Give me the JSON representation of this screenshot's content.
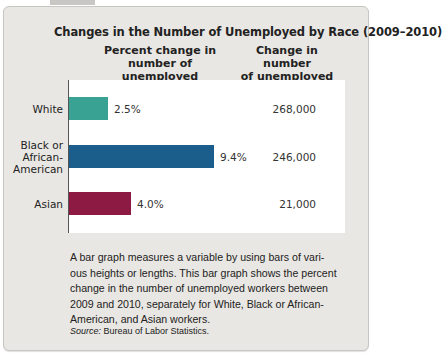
{
  "chart_data": {
    "type": "bar",
    "orientation": "horizontal",
    "title": "Changes in the Number of Unemployed by Race (2009–2010)",
    "column_headers": [
      "Percent change in\nnumber of unemployed",
      "Change in number\nof unemployed"
    ],
    "categories": [
      "White",
      "Black or\nAfrican-\nAmerican",
      "Asian"
    ],
    "series": [
      {
        "name": "Percent change in number of unemployed",
        "values": [
          2.5,
          9.4,
          4.0
        ],
        "labels": [
          "2.5%",
          "9.4%",
          "4.0%"
        ]
      },
      {
        "name": "Change in number of unemployed",
        "values": [
          268000,
          246000,
          21000
        ],
        "labels": [
          "268,000",
          "246,000",
          "21,000"
        ]
      }
    ],
    "colors": [
      "#3aa292",
      "#1b5e8c",
      "#8c1a42"
    ],
    "xlabel": "",
    "ylabel": "",
    "grid": false,
    "legend": "none"
  },
  "caption": "A bar graph measures a variable by using bars of vari-ous heights or lengths. This bar graph shows the percent change in the number of unemployed workers between 2009 and 2010, separately for White, Black or African-American, and Asian workers.",
  "source": {
    "label": "Source:",
    "text": " Bureau of Labor Statistics."
  }
}
